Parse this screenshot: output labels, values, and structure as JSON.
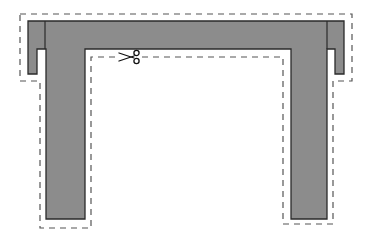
{
  "diagram": {
    "colors": {
      "background": "#ffffff",
      "fill": "#8c8c8c",
      "outline": "#2a2a2a",
      "cutline": "#555555",
      "scissors": "#111111"
    },
    "shape": {
      "name": "u-shaped-wall",
      "outline_points": [
        [
          28,
          21
        ],
        [
          344,
          21
        ],
        [
          344,
          74
        ],
        [
          335,
          74
        ],
        [
          335,
          49
        ],
        [
          327,
          49
        ],
        [
          327,
          219
        ],
        [
          291,
          219
        ],
        [
          291,
          49
        ],
        [
          85,
          49
        ],
        [
          85,
          219
        ],
        [
          46,
          219
        ],
        [
          46,
          49
        ],
        [
          37,
          49
        ],
        [
          37,
          74
        ],
        [
          28,
          74
        ]
      ],
      "dividers": [
        [
          [
            45,
            21
          ],
          [
            45,
            49
          ]
        ],
        [
          [
            327,
            21
          ],
          [
            327,
            49
          ]
        ]
      ]
    },
    "cut_line": {
      "style": "dashed",
      "points": [
        [
          20,
          14
        ],
        [
          352,
          14
        ],
        [
          352,
          81
        ],
        [
          333,
          81
        ],
        [
          333,
          224
        ],
        [
          283,
          224
        ],
        [
          283,
          57
        ],
        [
          91,
          57
        ],
        [
          91,
          228
        ],
        [
          40,
          228
        ],
        [
          40,
          81
        ],
        [
          20,
          81
        ],
        [
          20,
          14
        ]
      ]
    },
    "icons": [
      {
        "name": "scissors-icon",
        "x": 122,
        "y": 57
      }
    ]
  }
}
